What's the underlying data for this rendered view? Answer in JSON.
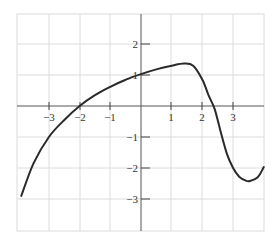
{
  "chart_data": {
    "type": "line",
    "title": "",
    "xlabel": "",
    "ylabel": "",
    "xlim": [
      -4,
      4
    ],
    "ylim": [
      -3.8,
      3.0
    ],
    "grid": true,
    "legend": null,
    "x_ticks": [
      -3,
      -2,
      -1,
      1,
      2,
      3
    ],
    "x_tick_labels": [
      "−3",
      "−2",
      "−1",
      "1",
      "2",
      "3"
    ],
    "y_ticks": [
      2,
      1,
      -1,
      -2,
      -3
    ],
    "y_tick_labels": [
      "2",
      "1",
      "−1",
      "−2",
      "−3"
    ],
    "series": [
      {
        "name": "f(x)",
        "x": [
          -3.9,
          -3.5,
          -3.0,
          -2.5,
          -2.0,
          -1.5,
          -1.0,
          -0.5,
          0.0,
          0.5,
          1.0,
          1.4,
          1.7,
          2.0,
          2.2,
          2.4,
          2.6,
          2.8,
          3.0,
          3.2,
          3.4,
          3.55,
          3.8,
          4.0
        ],
        "y": [
          -2.9,
          -1.85,
          -1.0,
          -0.45,
          0.0,
          0.35,
          0.62,
          0.85,
          1.03,
          1.18,
          1.3,
          1.37,
          1.3,
          0.85,
          0.35,
          -0.1,
          -0.85,
          -1.55,
          -2.0,
          -2.28,
          -2.4,
          -2.42,
          -2.3,
          -1.97
        ]
      }
    ]
  },
  "axis_labels": {
    "x": [
      "−3",
      "−2",
      "−1",
      "1",
      "2",
      "3"
    ],
    "y": [
      "2",
      "1",
      "−1",
      "−2",
      "−3"
    ]
  }
}
